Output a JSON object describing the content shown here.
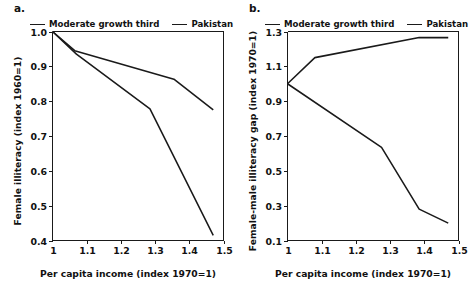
{
  "figure": {
    "width": 471,
    "height": 282,
    "background": "#ffffff",
    "line_color": "#1a1a1a"
  },
  "panels": [
    {
      "id": "a",
      "label": "a.",
      "legend": [
        {
          "name": "Moderate growth third"
        },
        {
          "name": "Pakistan"
        }
      ]
    },
    {
      "id": "b",
      "label": "b.",
      "legend": [
        {
          "name": "Moderate growth third"
        },
        {
          "name": "Pakistan"
        }
      ]
    }
  ],
  "chart_data": [
    {
      "type": "line",
      "panel": "a",
      "title": "a.",
      "xlabel": "Per capita income (index 1970=1)",
      "ylabel": "Female illiteracy (index 1960=1)",
      "xlim": [
        1.0,
        1.5
      ],
      "ylim": [
        0.4,
        1.0
      ],
      "xticks": [
        "1",
        "1.1",
        "1.2",
        "1.3",
        "1.4",
        "1.5"
      ],
      "xtick_values": [
        1.0,
        1.1,
        1.2,
        1.3,
        1.4,
        1.5
      ],
      "yticks": [
        "0.4",
        "0.5",
        "0.6",
        "0.7",
        "0.8",
        "0.9",
        "1.0"
      ],
      "ytick_values": [
        0.4,
        0.5,
        0.6,
        0.7,
        0.8,
        0.9,
        1.0
      ],
      "grid": false,
      "legend_position": "above-plot",
      "series": [
        {
          "name": "Pakistan",
          "x": [
            1.0,
            1.065,
            1.355,
            1.47
          ],
          "y": [
            1.0,
            0.945,
            0.863,
            0.775
          ]
        },
        {
          "name": "Moderate growth third",
          "x": [
            1.0,
            1.07,
            1.285,
            1.47
          ],
          "y": [
            1.0,
            0.935,
            0.778,
            0.415
          ]
        }
      ]
    },
    {
      "type": "line",
      "panel": "b",
      "title": "b.",
      "xlabel": "Per capita income (index 1970=1)",
      "ylabel": "Female-male illiteracy gap (index 1970=1)",
      "xlim": [
        1.0,
        1.5
      ],
      "ylim": [
        0.1,
        1.3
      ],
      "xticks": [
        "1",
        "1.1",
        "1.2",
        "1.3",
        "1.4",
        "1.5"
      ],
      "xtick_values": [
        1.0,
        1.1,
        1.2,
        1.3,
        1.4,
        1.5
      ],
      "yticks": [
        "0.1",
        "0.3",
        "0.5",
        "0.7",
        "0.9",
        "1.1",
        "1.3"
      ],
      "ytick_values": [
        0.1,
        0.3,
        0.5,
        0.7,
        0.9,
        1.1,
        1.3
      ],
      "grid": false,
      "legend_position": "above-plot",
      "series": [
        {
          "name": "Pakistan",
          "x": [
            1.0,
            1.08,
            1.385,
            1.47
          ],
          "y": [
            1.0,
            1.15,
            1.265,
            1.265
          ]
        },
        {
          "name": "Moderate growth third",
          "x": [
            1.0,
            1.275,
            1.385,
            1.47
          ],
          "y": [
            1.0,
            0.635,
            0.28,
            0.2
          ]
        }
      ]
    }
  ]
}
